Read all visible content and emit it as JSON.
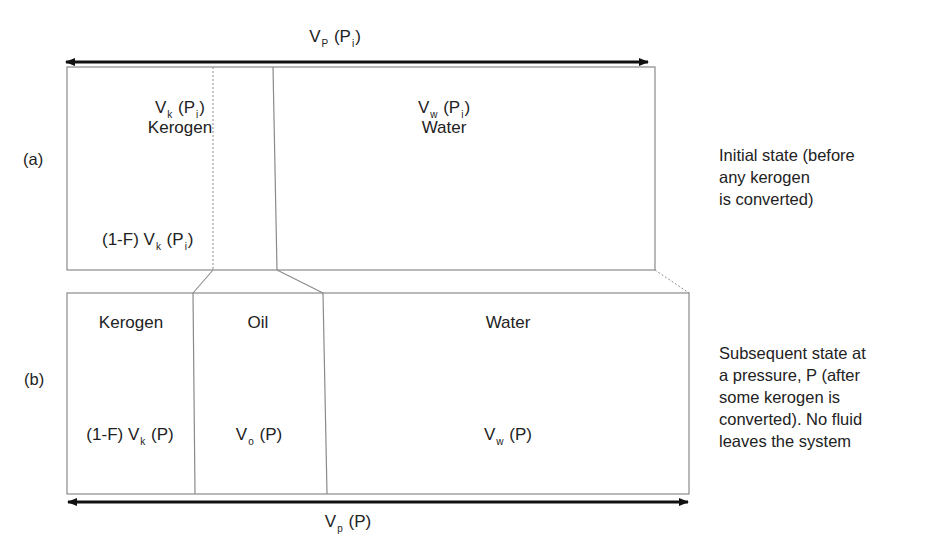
{
  "diagram": {
    "panels": {
      "a": {
        "tag": "(a)",
        "description": "Initial state (before\nany kerogen\nis converted)",
        "total_volume": {
          "main": "V",
          "sub": "P",
          "arg": " (P",
          "arg_sub": "i",
          "close": ")"
        },
        "kerogen": {
          "volume": {
            "main": "V",
            "sub": "k",
            "arg": " (P",
            "arg_sub": "i",
            "close": ")"
          },
          "name": "Kerogen",
          "unconverted": {
            "prefix": "(1-F) V",
            "sub": "k",
            "arg": " (P",
            "arg_sub": "i",
            "close": ")"
          }
        },
        "water": {
          "volume": {
            "main": "V",
            "sub": "w",
            "arg": " (P",
            "arg_sub": "i",
            "close": ")"
          },
          "name": "Water"
        }
      },
      "b": {
        "tag": "(b)",
        "description": "Subsequent state at\na pressure, P (after\nsome kerogen is\nconverted). No fluid\nleaves the system",
        "total_volume": {
          "main": "V",
          "sub": "p",
          "arg": " (P)"
        },
        "kerogen": {
          "name": "Kerogen",
          "volume": {
            "prefix": "(1-F) V",
            "sub": "k",
            "arg": " (P)"
          }
        },
        "oil": {
          "name": "Oil",
          "volume": {
            "main": "V",
            "sub": "o",
            "arg": " (P)"
          }
        },
        "water": {
          "name": "Water",
          "volume": {
            "main": "V",
            "sub": "w",
            "arg": " (P)"
          }
        }
      }
    },
    "colors": {
      "box_line": "#8a8a8a",
      "arrow": "#111111",
      "text": "#222222"
    }
  }
}
